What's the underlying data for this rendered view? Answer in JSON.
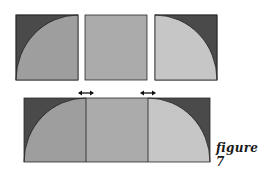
{
  "caption": "figure 7",
  "colors": {
    "dark": "#4a4a4a",
    "medium": "#9e9e9e",
    "middle": "#ababab",
    "light": "#c6c6c6",
    "outline": "#2a2a2a"
  },
  "top_row": [
    {
      "name": "square-left-quarter-circle",
      "fill": "medium",
      "corner": "top-left"
    },
    {
      "name": "square-plain",
      "fill": "middle"
    },
    {
      "name": "square-right-quarter-circle",
      "fill": "light",
      "corner": "top-right"
    }
  ],
  "bottom_row": {
    "name": "joined-rectangle",
    "segments": [
      "medium",
      "middle",
      "light"
    ],
    "arrows": [
      "seam-left",
      "seam-right"
    ]
  }
}
